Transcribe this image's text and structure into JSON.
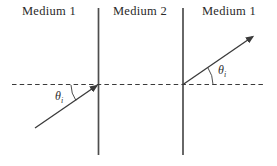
{
  "diagram": {
    "regions": [
      {
        "label": "Medium 1"
      },
      {
        "label": "Medium 2"
      },
      {
        "label": "Medium 1"
      }
    ],
    "angles": {
      "incident": {
        "symbol": "θ",
        "subscript": "i"
      },
      "transmitted": {
        "symbol": "θ",
        "subscript": "i"
      }
    },
    "colors": {
      "background": "#ffffff",
      "boundary_line": "#4d4d4d",
      "ray_line": "#3a3a3a",
      "normal_dashed_line": "#3a3a3a",
      "text": "#2a2a2a"
    }
  }
}
